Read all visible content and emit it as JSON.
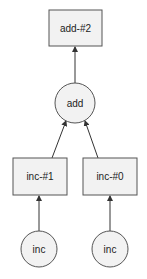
{
  "diagram": {
    "type": "computation-graph",
    "colors": {
      "node_fill": "#f2f2f2",
      "stroke": "#555555",
      "edge": "#333333",
      "text": "#222222"
    },
    "nodes": [
      {
        "id": "add2",
        "label": "add-#2",
        "shape": "rect"
      },
      {
        "id": "add",
        "label": "add",
        "shape": "circle"
      },
      {
        "id": "inc1",
        "label": "inc-#1",
        "shape": "rect"
      },
      {
        "id": "inc0",
        "label": "inc-#0",
        "shape": "rect"
      },
      {
        "id": "incL",
        "label": "inc",
        "shape": "circle"
      },
      {
        "id": "incR",
        "label": "inc",
        "shape": "circle"
      }
    ],
    "edges": [
      {
        "from": "add",
        "to": "add2"
      },
      {
        "from": "inc1",
        "to": "add"
      },
      {
        "from": "inc0",
        "to": "add"
      },
      {
        "from": "incL",
        "to": "inc1"
      },
      {
        "from": "incR",
        "to": "inc0"
      }
    ]
  }
}
